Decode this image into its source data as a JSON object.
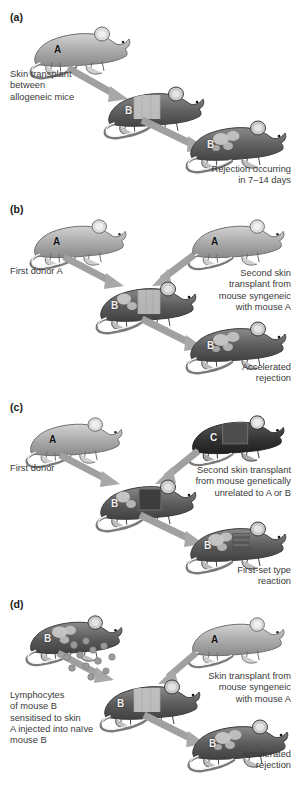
{
  "figure": {
    "background_color": "#ffffff",
    "text_color": "#3a3a3a"
  },
  "palette": {
    "mouse_light": "#b8b8b8",
    "mouse_mid": "#8e8e8e",
    "mouse_dark": "#5a5a5a",
    "mouse_darkest": "#3c3c3c",
    "graft_light": "#c9c9c9",
    "graft_dark": "#4a4a4a",
    "arrow": "#9a9a9a",
    "outline": "#5f5f5f",
    "tail": "#f2f2f2",
    "lymphocyte": "#9e9e9e"
  },
  "panels": [
    {
      "id": "a",
      "label": "(a)",
      "captions": [
        {
          "id": "a-left",
          "text": "Skin transplant\nbetween\nallogeneic mice",
          "align": "left"
        },
        {
          "id": "a-right",
          "text": "Rejection occurring\nin 7–14 days",
          "align": "right"
        }
      ],
      "mice": [
        {
          "id": "a-donor",
          "letter": "A",
          "shade": "light",
          "graft": "none"
        },
        {
          "id": "a-recipient",
          "letter": "B",
          "shade": "dark",
          "graft": "light-patch"
        },
        {
          "id": "a-rejecting",
          "letter": "B",
          "shade": "dark",
          "graft": "rejected-blotches"
        }
      ],
      "arrows": [
        {
          "id": "a-arrow-1",
          "from": "a-donor",
          "to": "a-recipient"
        },
        {
          "id": "a-arrow-2",
          "from": "a-recipient",
          "to": "a-rejecting"
        }
      ]
    },
    {
      "id": "b",
      "label": "(b)",
      "captions": [
        {
          "id": "b-left",
          "text": "First donor A",
          "align": "left"
        },
        {
          "id": "b-right",
          "text": "Second skin\ntransplant from\nmouse syngeneic\nwith mouse A",
          "align": "right"
        },
        {
          "id": "b-result",
          "text": "Accelerated\nrejection",
          "align": "right"
        }
      ],
      "mice": [
        {
          "id": "b-donor",
          "letter": "A",
          "shade": "light",
          "graft": "none"
        },
        {
          "id": "b-second-donor",
          "letter": "A",
          "shade": "light",
          "graft": "none"
        },
        {
          "id": "b-recipient",
          "letter": "B",
          "shade": "dark",
          "graft": "light-patch-and-blotches"
        },
        {
          "id": "b-rejecting",
          "letter": "B",
          "shade": "dark",
          "graft": "rejected-blotches"
        }
      ],
      "arrows": [
        {
          "id": "b-arrow-1",
          "from": "b-donor",
          "to": "b-recipient"
        },
        {
          "id": "b-arrow-2",
          "from": "b-second-donor",
          "to": "b-recipient"
        },
        {
          "id": "b-arrow-3",
          "from": "b-recipient",
          "to": "b-rejecting"
        }
      ]
    },
    {
      "id": "c",
      "label": "(c)",
      "captions": [
        {
          "id": "c-left",
          "text": "First donor",
          "align": "left"
        },
        {
          "id": "c-right",
          "text": "Second skin transplant\nfrom mouse genetically\nunrelated to A or B",
          "align": "right"
        },
        {
          "id": "c-result",
          "text": "First-set type\nreaction",
          "align": "right"
        }
      ],
      "mice": [
        {
          "id": "c-donor",
          "letter": "A",
          "shade": "light",
          "graft": "none"
        },
        {
          "id": "c-third-party",
          "letter": "C",
          "shade": "darkest",
          "graft": "dark-patch"
        },
        {
          "id": "c-recipient",
          "letter": "B",
          "shade": "dark",
          "graft": "dark-patch-and-blotches"
        },
        {
          "id": "c-rejecting",
          "letter": "B",
          "shade": "dark",
          "graft": "rejected-blotches"
        }
      ],
      "arrows": [
        {
          "id": "c-arrow-1",
          "from": "c-donor",
          "to": "c-recipient"
        },
        {
          "id": "c-arrow-2",
          "from": "c-third-party",
          "to": "c-recipient"
        },
        {
          "id": "c-arrow-3",
          "from": "c-recipient",
          "to": "c-rejecting"
        }
      ]
    },
    {
      "id": "d",
      "label": "(d)",
      "captions": [
        {
          "id": "d-left",
          "text": "Lymphocytes\nof mouse B\nsensitised to skin\nA injected into naïve\nmouse B",
          "align": "left"
        },
        {
          "id": "d-right",
          "text": "Skin transplant from\nmouse syngeneic\nwith mouse A",
          "align": "right"
        },
        {
          "id": "d-result",
          "text": "Accelerated\nrejection",
          "align": "right"
        }
      ],
      "mice": [
        {
          "id": "d-sensitised",
          "letter": "B",
          "shade": "dark",
          "graft": "rejected-blotches"
        },
        {
          "id": "d-donor",
          "letter": "A",
          "shade": "light",
          "graft": "none"
        },
        {
          "id": "d-recipient",
          "letter": "B",
          "shade": "dark",
          "graft": "light-patch"
        },
        {
          "id": "d-rejecting",
          "letter": "B",
          "shade": "dark",
          "graft": "rejected-blotches"
        }
      ],
      "arrows": [
        {
          "id": "d-arrow-1",
          "from": "d-sensitised",
          "to": "d-recipient"
        },
        {
          "id": "d-arrow-2",
          "from": "d-donor",
          "to": "d-recipient"
        },
        {
          "id": "d-arrow-3",
          "from": "d-recipient",
          "to": "d-rejecting"
        }
      ],
      "lymphocytes": {
        "id": "d-lymphocyte-dots",
        "count": 12
      }
    }
  ]
}
